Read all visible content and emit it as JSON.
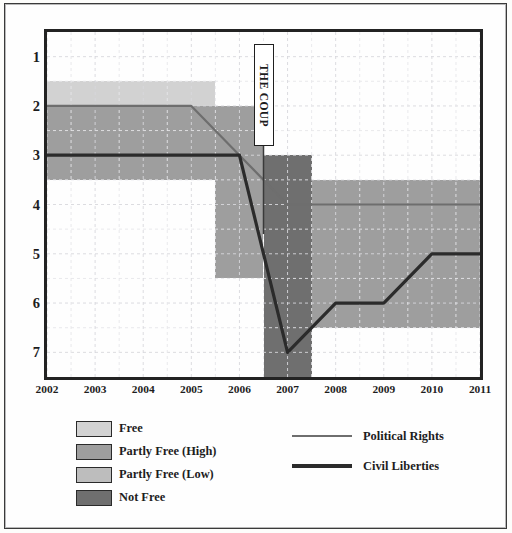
{
  "chart_data": {
    "type": "line",
    "title": "",
    "subtitle": "",
    "xlabel": "",
    "ylabel": "",
    "x": [
      2002,
      2003,
      2004,
      2005,
      2006,
      2007,
      2008,
      2009,
      2010,
      2011
    ],
    "categories": [
      "2002",
      "2003",
      "2004",
      "2005",
      "2006",
      "2007",
      "2008",
      "2009",
      "2010",
      "2011"
    ],
    "ylim": [
      7.5,
      0.5
    ],
    "y_inverted": true,
    "yticks": [
      "1",
      "2",
      "3",
      "4",
      "5",
      "6",
      "7"
    ],
    "ytick_values": [
      1,
      2,
      3,
      4,
      5,
      6,
      7
    ],
    "grid": true,
    "grid_style": "dashed-minor-and-major",
    "legend_position": "below-plot",
    "series": [
      {
        "name": "Political Rights",
        "color": "#6e6e6e",
        "width": 2.2,
        "values": [
          2,
          2,
          2,
          2,
          3,
          4,
          4,
          4,
          4,
          4
        ]
      },
      {
        "name": "Civil Liberties",
        "color": "#2b2b2b",
        "width": 3.2,
        "values": [
          3,
          3,
          3,
          3,
          3,
          7,
          6,
          6,
          5,
          5
        ]
      }
    ],
    "bands": [
      {
        "label": "Free",
        "color": "#d2d2d2",
        "x0": 2002,
        "x1": 2005.5,
        "y0": 1.5,
        "y1": 2.0
      },
      {
        "label": "Partly Free (High)",
        "color": "#9e9e9e",
        "x0": 2002,
        "x1": 2005.5,
        "y0": 2.0,
        "y1": 3.5
      },
      {
        "label": "Partly Free (High)",
        "color": "#9e9e9e",
        "x0": 2005.5,
        "x1": 2006.5,
        "y0": 2.0,
        "y1": 5.5
      },
      {
        "label": "Not Free",
        "color": "#6f6f6f",
        "x0": 2006.5,
        "x1": 2007.5,
        "y0": 3.0,
        "y1": 7.5
      },
      {
        "label": "Partly Free (Low)",
        "color": "#9e9e9e",
        "x0": 2007.5,
        "x1": 2011,
        "y0": 3.5,
        "y1": 6.5
      }
    ],
    "annotations": [
      {
        "text": "THE COUP",
        "x": 2006.5,
        "orientation": "vertical"
      }
    ]
  },
  "legend": {
    "swatches": [
      {
        "label": "Free",
        "color": "#d2d2d2"
      },
      {
        "label": "Partly Free (High)",
        "color": "#9e9e9e"
      },
      {
        "label": "Partly Free (Low)",
        "color": "#bdbdbd"
      },
      {
        "label": "Not Free",
        "color": "#6f6f6f"
      }
    ],
    "lines": [
      {
        "label": "Political Rights",
        "color": "#6e6e6e",
        "width": 2.2
      },
      {
        "label": "Civil Liberties",
        "color": "#2b2b2b",
        "width": 3.4
      }
    ]
  }
}
